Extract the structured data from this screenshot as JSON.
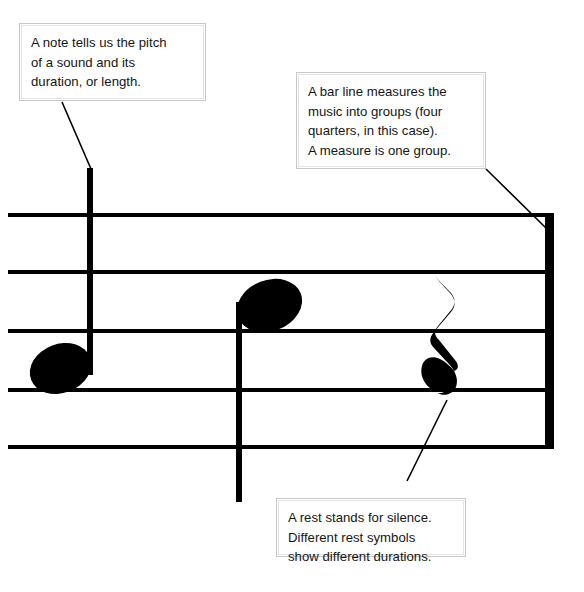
{
  "diagram": {
    "background_color": "#ffffff",
    "ink_color": "#000000",
    "box_border_color": "#c8c8c8"
  },
  "callouts": [
    {
      "id": "note",
      "lines": [
        "A note tells us the pitch",
        "of a sound and its",
        "duration, or length."
      ],
      "points_to": "quarter-note-1"
    },
    {
      "id": "barline",
      "lines": [
        "A bar line measures the",
        "music into groups (four",
        "quarters, in this case).",
        "A measure is one group."
      ],
      "points_to": "bar-line"
    },
    {
      "id": "rest",
      "lines": [
        "A rest stands for silence.",
        "Different rest symbols",
        "show different durations."
      ],
      "points_to": "quarter-rest"
    }
  ],
  "staff": {
    "line_count": 5,
    "symbols": [
      {
        "kind": "quarter-note",
        "label": "quarter-note-1",
        "stem_direction": "up"
      },
      {
        "kind": "quarter-note",
        "label": "quarter-note-2",
        "stem_direction": "down"
      },
      {
        "kind": "quarter-rest",
        "label": "quarter-rest"
      },
      {
        "kind": "bar-line",
        "label": "bar-line",
        "weight": "thick"
      }
    ]
  }
}
